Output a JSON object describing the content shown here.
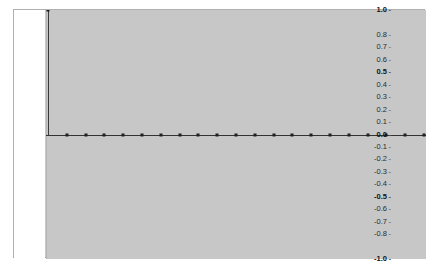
{
  "figure": {
    "background_color": "#ffffff",
    "panel_color": "#c9c9c9",
    "plot_area_color": "#c7c7c7",
    "axis_color": "#333333",
    "marker_color": "#1f1f1f",
    "stem_color": "#3a3a3a",
    "label_strip_color": "#ffffff"
  },
  "chart_data": {
    "type": "line",
    "title": "",
    "subtitle": "",
    "xlabel": "",
    "ylabel": "",
    "ylim": [
      -1.0,
      1.0
    ],
    "xlim": [
      0,
      20
    ],
    "grid": false,
    "legend": null,
    "legend_position": "none",
    "ytick_values": [
      1.0,
      0.8,
      0.7,
      0.6,
      0.5,
      0.4,
      0.3,
      0.2,
      0.1,
      0.0,
      -0.1,
      -0.2,
      -0.3,
      -0.4,
      -0.5,
      -0.6,
      -0.7,
      -0.8,
      -1.0
    ],
    "ytick_labels": [
      "1.0",
      "0.8",
      "0.7",
      "0.6",
      "0.5",
      "0.4",
      "0.3",
      "0.2",
      "0.1",
      "0.0",
      "-0.1",
      "-0.2",
      "-0.3",
      "-0.4",
      "-0.5",
      "-0.6",
      "-0.7",
      "-0.8",
      "-1.0"
    ],
    "ytick_bold": [
      true,
      false,
      false,
      false,
      true,
      false,
      false,
      false,
      false,
      true,
      false,
      false,
      false,
      false,
      true,
      false,
      false,
      false,
      true
    ],
    "xtick_labels": [],
    "series": [
      {
        "name": "autocorrelation",
        "x": [
          0,
          1,
          2,
          3,
          4,
          5,
          6,
          7,
          8,
          9,
          10,
          11,
          12,
          13,
          14,
          15,
          16,
          17,
          18,
          19,
          20
        ],
        "values": [
          1.0,
          0.0,
          0.0,
          0.0,
          0.0,
          0.0,
          0.0,
          0.0,
          0.0,
          0.0,
          0.0,
          0.0,
          0.0,
          0.0,
          0.0,
          0.0,
          0.0,
          0.0,
          0.0,
          0.0,
          0.0
        ]
      }
    ],
    "annotations": []
  }
}
